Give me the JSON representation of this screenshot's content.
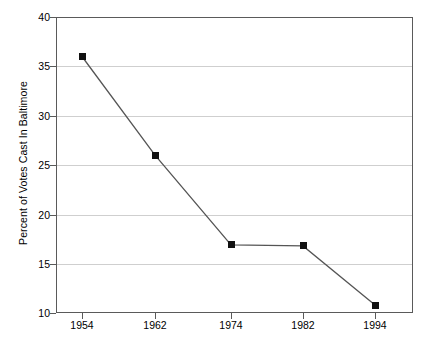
{
  "chart_data": {
    "type": "line",
    "title": "",
    "subtitle": "",
    "xlabel": "",
    "ylabel": "Percent of Votes Cast In Baltimore",
    "categories": [
      "1954",
      "1962",
      "1974",
      "1982",
      "1994"
    ],
    "x": [
      1954,
      1962,
      1974,
      1982,
      1994
    ],
    "values": [
      36.0,
      26.0,
      16.9,
      16.8,
      10.8
    ],
    "series": [
      {
        "name": "Percent of Votes Cast In Baltimore",
        "values": [
          36.0,
          26.0,
          16.9,
          16.8,
          10.8
        ]
      }
    ],
    "ylim": [
      10,
      40
    ],
    "yticks": [
      10,
      15,
      20,
      25,
      30,
      35,
      40
    ],
    "ytick_labels": [
      "10",
      "15",
      "20",
      "25",
      "30",
      "35",
      "40"
    ],
    "xtick_labels": [
      "1954",
      "1962",
      "1974",
      "1982",
      "1994"
    ],
    "grid": true,
    "grid_axis": "y",
    "legend": false,
    "legend_position": "none",
    "marker": "square",
    "marker_color": "#111111",
    "line_color": "#555555",
    "grid_color": "#cfcfcf",
    "axis_color": "#5a5a5a",
    "background": "#ffffff",
    "annotations": []
  },
  "axes": {
    "y_labels": [
      "40",
      "35",
      "30",
      "25",
      "20",
      "15",
      "10"
    ],
    "x_labels": [
      "1954",
      "1962",
      "1974",
      "1982",
      "1994"
    ],
    "y_title": "Percent of Votes Cast In Baltimore"
  }
}
